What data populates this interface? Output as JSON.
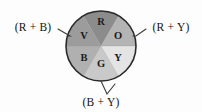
{
  "figure": {
    "background_color": "#fdfdfd",
    "outline_color": "#2a2a2a"
  },
  "wheel": {
    "center_x": 101,
    "center_y": 46,
    "radius": 35,
    "sectors": [
      {
        "id": "red",
        "label": "R",
        "start_angle": -30,
        "end_angle": 30,
        "color": "#8c8c8c",
        "label_x": 101,
        "label_y": 21
      },
      {
        "id": "orange",
        "label": "O",
        "start_angle": 30,
        "end_angle": 90,
        "color": "#b4b4b4",
        "label_x": 118,
        "label_y": 35
      },
      {
        "id": "yellow",
        "label": "Y",
        "start_angle": 90,
        "end_angle": 150,
        "color": "#e4e4e4",
        "label_x": 118,
        "label_y": 57
      },
      {
        "id": "green",
        "label": "G",
        "start_angle": 150,
        "end_angle": 210,
        "color": "#c9c9c9",
        "label_x": 101,
        "label_y": 63
      },
      {
        "id": "blue",
        "label": "B",
        "start_angle": 210,
        "end_angle": 270,
        "color": "#b0b0b0",
        "label_x": 84,
        "label_y": 57
      },
      {
        "id": "violet",
        "label": "V",
        "start_angle": 270,
        "end_angle": 330,
        "color": "#9c9c9c",
        "label_x": 84,
        "label_y": 35
      }
    ]
  },
  "callouts": [
    {
      "id": "left",
      "text": "(R + B)",
      "text_x": 33,
      "text_y": 27,
      "leader_path": "M 58 29 L 70 36 L 67 36"
    },
    {
      "id": "right",
      "text": "(R + Y)",
      "text_x": 171,
      "text_y": 27,
      "leader_path": "M 146 29 L 136 36 L 133 36"
    },
    {
      "id": "bottom",
      "text": "(B + Y)",
      "text_x": 101,
      "text_y": 102,
      "leader_path": "M 115 84 L 107 94 L 101 81"
    }
  ]
}
